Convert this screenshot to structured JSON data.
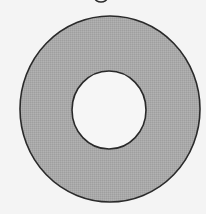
{
  "figure": {
    "type": "annulus",
    "description": "Shaded ring between two concentric circles",
    "colors": {
      "background": "#f4f4f4",
      "ring_fill": "#a9a9a9",
      "outline": "#2a2a2a",
      "inner_fill": "#f6f6f6"
    },
    "outer_circle": {
      "cx": 110,
      "cy": 109,
      "rx": 90,
      "ry": 93
    },
    "inner_circle": {
      "cx": 109,
      "cy": 110,
      "rx": 37,
      "ry": 39
    },
    "stroke_width": 1.6,
    "cropped_glyph_fragment": {
      "cx": 101,
      "cy": -2,
      "rx": 6,
      "ry": 4
    }
  }
}
